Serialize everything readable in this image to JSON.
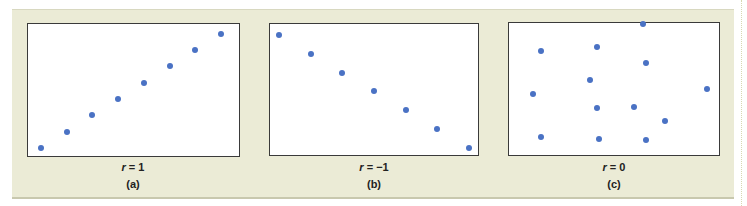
{
  "chart_data": [
    {
      "type": "scatter",
      "label": "(a)",
      "title": "r = 1",
      "r_symbol": "r",
      "r_value": "= 1",
      "points": [
        [
          1,
          1
        ],
        [
          2,
          2
        ],
        [
          3,
          3
        ],
        [
          4,
          4
        ],
        [
          5,
          5
        ],
        [
          6,
          6
        ],
        [
          7,
          7
        ],
        [
          8,
          8
        ]
      ],
      "grid": false,
      "axes_ticks": false
    },
    {
      "type": "scatter",
      "label": "(b)",
      "title": "r = −1",
      "r_symbol": "r",
      "r_value": "= −1",
      "points": [
        [
          1,
          7
        ],
        [
          2,
          6
        ],
        [
          3,
          5
        ],
        [
          4,
          4
        ],
        [
          5,
          3
        ],
        [
          6,
          2
        ],
        [
          7,
          1
        ]
      ],
      "grid": false,
      "axes_ticks": false
    },
    {
      "type": "scatter",
      "label": "(c)",
      "title": "r = 0",
      "r_symbol": "r",
      "r_value": "= 0",
      "points": [
        [
          1.0,
          4.8
        ],
        [
          1.3,
          8.0
        ],
        [
          1.3,
          1.6
        ],
        [
          3.3,
          5.9
        ],
        [
          3.6,
          8.3
        ],
        [
          3.6,
          3.8
        ],
        [
          3.7,
          1.5
        ],
        [
          5.1,
          3.9
        ],
        [
          5.5,
          10.0
        ],
        [
          5.6,
          7.1
        ],
        [
          5.6,
          1.4
        ],
        [
          6.4,
          2.8
        ],
        [
          8.1,
          5.2
        ]
      ],
      "grid": false,
      "axes_ticks": false
    }
  ],
  "colors": {
    "frame_bg": "#ebebd6",
    "dot": "#4a72c4",
    "plot_border": "#3a3a3a"
  }
}
